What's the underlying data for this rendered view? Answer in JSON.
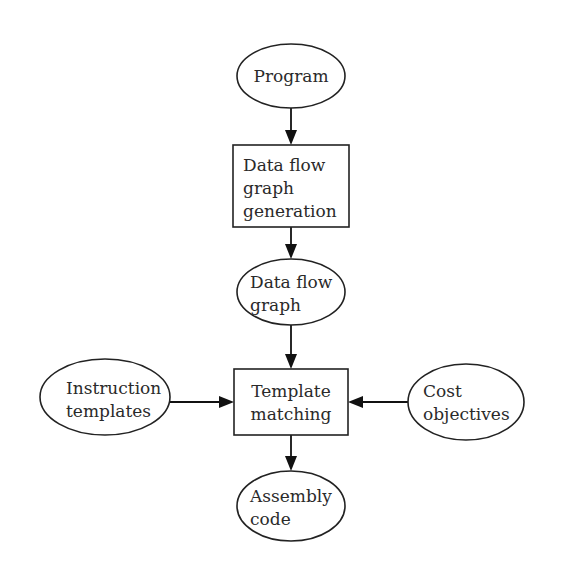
{
  "diagram": {
    "type": "flowchart",
    "nodes": [
      {
        "id": "program",
        "shape": "ellipse",
        "lines": [
          "Program"
        ]
      },
      {
        "id": "dfg_generation",
        "shape": "rectangle",
        "lines": [
          "Data flow",
          "graph",
          "generation"
        ]
      },
      {
        "id": "dfg",
        "shape": "ellipse",
        "lines": [
          "Data flow",
          "graph"
        ]
      },
      {
        "id": "instruction_templates",
        "shape": "ellipse",
        "lines": [
          "Instruction",
          "templates"
        ]
      },
      {
        "id": "template_matching",
        "shape": "rectangle",
        "lines": [
          "Template",
          "matching"
        ]
      },
      {
        "id": "cost_objectives",
        "shape": "ellipse",
        "lines": [
          "Cost",
          "objectives"
        ]
      },
      {
        "id": "assembly_code",
        "shape": "ellipse",
        "lines": [
          "Assembly",
          "code"
        ]
      }
    ],
    "edges": [
      {
        "from": "program",
        "to": "dfg_generation"
      },
      {
        "from": "dfg_generation",
        "to": "dfg"
      },
      {
        "from": "dfg",
        "to": "template_matching"
      },
      {
        "from": "instruction_templates",
        "to": "template_matching"
      },
      {
        "from": "cost_objectives",
        "to": "template_matching"
      },
      {
        "from": "template_matching",
        "to": "assembly_code"
      }
    ],
    "colors": {
      "stroke": "#222222",
      "text": "#2a2a2a",
      "background": "#ffffff"
    }
  }
}
